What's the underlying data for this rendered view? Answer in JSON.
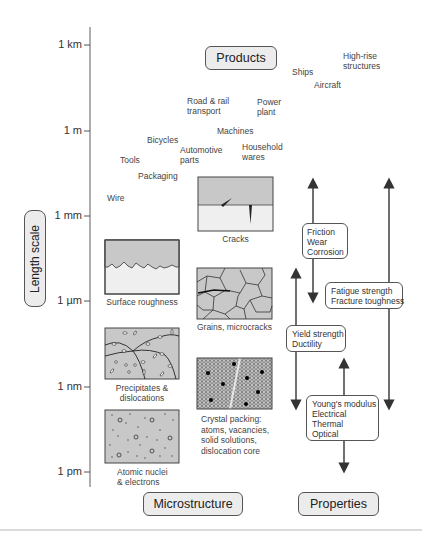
{
  "axis": {
    "title": "Length scale",
    "ticks": [
      {
        "label": "1 km",
        "y": 45
      },
      {
        "label": "1 m",
        "y": 131
      },
      {
        "label": "1 mm",
        "y": 216
      },
      {
        "label": "1 µm",
        "y": 301
      },
      {
        "label": "1 nm",
        "y": 387
      },
      {
        "label": "1 pm",
        "y": 472
      }
    ]
  },
  "headers": {
    "products": "Products",
    "microstructure": "Microstructure",
    "properties": "Properties"
  },
  "products": {
    "high_rise_1": "High-rise",
    "high_rise_2": "structures",
    "ships": "Ships",
    "aircraft": "Aircraft",
    "road_1": "Road & rail",
    "road_2": "transport",
    "power_1": "Power",
    "power_2": "plant",
    "machines": "Machines",
    "bicycles": "Bicycles",
    "auto_1": "Automotive",
    "auto_2": "parts",
    "household_1": "Household",
    "household_2": "wares",
    "tools": "Tools",
    "packaging": "Packaging",
    "wire": "Wire"
  },
  "microstructure": {
    "cracks": "Cracks",
    "surface": "Surface roughness",
    "grains": "Grains, microcracks",
    "precip_1": "Precipitates &",
    "precip_2": "dislocations",
    "crystal_1": "Crystal packing:",
    "crystal_2": "atoms, vacancies,",
    "crystal_3": "solid solutions,",
    "crystal_4": "dislocation core",
    "atomic_1": "Atomic nuclei",
    "atomic_2": "& electrons"
  },
  "properties": {
    "friction": [
      "Friction",
      "Wear",
      "Corrosion"
    ],
    "fatigue": [
      "Fatigue strength",
      "Fracture toughness"
    ],
    "yield": [
      "Yield strength",
      "Ductility"
    ],
    "youngs": [
      "Young's modulus",
      "Electrical",
      "Thermal",
      "Optical"
    ]
  },
  "colors": {
    "panel_fill": "#c8c8c8",
    "panel_light": "#ececec",
    "line": "#444444",
    "pill_fill": "#ececec"
  }
}
